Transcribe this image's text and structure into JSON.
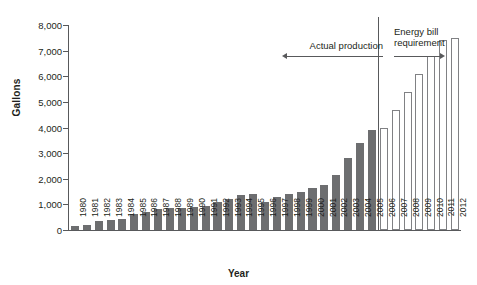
{
  "chart_data": {
    "type": "bar",
    "title": "",
    "xlabel": "Year",
    "ylabel": "Gallons",
    "ylim": [
      0,
      8000
    ],
    "ytick_labels": [
      "0",
      "1,000",
      "2,000",
      "3,000",
      "4,000",
      "5,000",
      "6,000",
      "7,000",
      "8,000"
    ],
    "ytick_values": [
      0,
      1000,
      2000,
      3000,
      4000,
      5000,
      6000,
      7000,
      8000
    ],
    "grid": false,
    "legend_position": "none",
    "categories": [
      "1980",
      "1981",
      "1982",
      "1983",
      "1984",
      "1985",
      "1986",
      "1987",
      "1988",
      "1989",
      "1990",
      "1991",
      "1992",
      "1993",
      "1994",
      "1995",
      "1996",
      "1997",
      "1998",
      "1999",
      "2000",
      "2001",
      "2002",
      "2003",
      "2004",
      "2005",
      "2006",
      "2007",
      "2008",
      "2009",
      "2010",
      "2011",
      "2012"
    ],
    "series": [
      {
        "name": "Actual production",
        "style": "filled",
        "color": "#6d6e70",
        "values": [
          175,
          215,
          350,
          375,
          430,
          610,
          710,
          830,
          845,
          870,
          900,
          950,
          1100,
          1200,
          1350,
          1400,
          1100,
          1300,
          1400,
          1470,
          1630,
          1770,
          2130,
          2800,
          3400,
          3900,
          null,
          null,
          null,
          null,
          null,
          null,
          null
        ]
      },
      {
        "name": "Energy bill requirement",
        "style": "outlined",
        "color": "#ffffff",
        "border_color": "#808184",
        "values": [
          null,
          null,
          null,
          null,
          null,
          null,
          null,
          null,
          null,
          null,
          null,
          null,
          null,
          null,
          null,
          null,
          null,
          null,
          null,
          null,
          null,
          null,
          null,
          null,
          null,
          null,
          4000,
          4700,
          5400,
          6100,
          6800,
          7400,
          7500
        ]
      }
    ],
    "annotations": [
      {
        "id": "actual-production",
        "text": "Actual production",
        "arrow": "left"
      },
      {
        "id": "energy-bill-requirement",
        "text": "Energy bill\nrequirement",
        "text_line1": "Energy bill",
        "text_line2": "requirement",
        "arrow": "right"
      }
    ],
    "divider": {
      "after_category": "2005",
      "description": "vertical rule separating actual production from energy bill requirement"
    }
  }
}
